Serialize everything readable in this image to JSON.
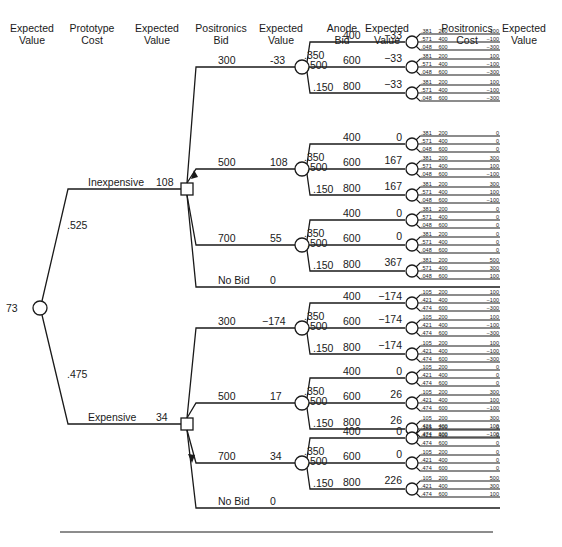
{
  "headers": [
    {
      "text": "Expected\nValue",
      "x": 5
    },
    {
      "text": "Prototype\nCost",
      "x": 65
    },
    {
      "text": "Expected\nValue",
      "x": 130
    },
    {
      "text": "Positronics\nBid",
      "x": 194
    },
    {
      "text": "Expected\nValue",
      "x": 254
    },
    {
      "text": "Anode\nBid",
      "x": 315
    },
    {
      "text": "Expected\nValue",
      "x": 360
    },
    {
      "text": "Positronics\nCost",
      "x": 440
    },
    {
      "text": "Expected\nValue",
      "x": 497
    }
  ],
  "root": {
    "expected_value": "73"
  },
  "prototype_cost": [
    {
      "label": "Inexpensive",
      "probability": ".525",
      "expected_value": "108",
      "bids": [
        {
          "bid": "300",
          "ev": "-33",
          "anode_probs": [
            ".350",
            ".500",
            ".150"
          ],
          "anodes": [
            {
              "bid": "400",
              "ev": "−33",
              "leaves": [
                [
                  "381",
                  "200",
                  "100"
                ],
                [
                  "571",
                  "400",
                  "−100"
                ],
                [
                  "048",
                  "600",
                  "−300"
                ]
              ]
            },
            {
              "bid": "600",
              "ev": "−33",
              "leaves": [
                [
                  "381",
                  "200",
                  "100"
                ],
                [
                  "571",
                  "400",
                  "−100"
                ],
                [
                  "048",
                  "600",
                  "−300"
                ]
              ]
            },
            {
              "bid": "800",
              "ev": "−33",
              "leaves": [
                [
                  "381",
                  "200",
                  "100"
                ],
                [
                  "571",
                  "400",
                  "−100"
                ],
                [
                  "048",
                  "600",
                  "−300"
                ]
              ]
            }
          ]
        },
        {
          "bid": "500",
          "ev": "108",
          "anode_probs": [
            ".350",
            ".500",
            ".150"
          ],
          "anodes": [
            {
              "bid": "400",
              "ev": "0",
              "leaves": [
                [
                  "381",
                  "200",
                  "0"
                ],
                [
                  "571",
                  "400",
                  "0"
                ],
                [
                  "048",
                  "600",
                  "0"
                ]
              ]
            },
            {
              "bid": "600",
              "ev": "167",
              "leaves": [
                [
                  "381",
                  "200",
                  "300"
                ],
                [
                  "571",
                  "400",
                  "100"
                ],
                [
                  "048",
                  "600",
                  "−100"
                ]
              ]
            },
            {
              "bid": "800",
              "ev": "167",
              "leaves": [
                [
                  "381",
                  "200",
                  "300"
                ],
                [
                  "571",
                  "400",
                  "100"
                ],
                [
                  "048",
                  "600",
                  "−100"
                ]
              ]
            }
          ]
        },
        {
          "bid": "700",
          "ev": "55",
          "anode_probs": [
            ".350",
            ".500",
            ".150"
          ],
          "anodes": [
            {
              "bid": "400",
              "ev": "0",
              "leaves": [
                [
                  "381",
                  "200",
                  "0"
                ],
                [
                  "571",
                  "400",
                  "0"
                ],
                [
                  "048",
                  "600",
                  "0"
                ]
              ]
            },
            {
              "bid": "600",
              "ev": "0",
              "leaves": [
                [
                  "381",
                  "200",
                  "0"
                ],
                [
                  "571",
                  "400",
                  "0"
                ],
                [
                  "048",
                  "600",
                  "0"
                ]
              ]
            },
            {
              "bid": "800",
              "ev": "367",
              "leaves": [
                [
                  "381",
                  "200",
                  "500"
                ],
                [
                  "571",
                  "400",
                  "300"
                ],
                [
                  "048",
                  "600",
                  "100"
                ]
              ]
            }
          ]
        },
        {
          "bid": "No Bid",
          "ev": "0"
        }
      ]
    },
    {
      "label": "Expensive",
      "probability": ".475",
      "expected_value": "34",
      "bids": [
        {
          "bid": "300",
          "ev": "−174",
          "anode_probs": [
            ".350",
            ".500",
            ".150"
          ],
          "anodes": [
            {
              "bid": "400",
              "ev": "−174",
              "leaves": [
                [
                  "105",
                  "200",
                  "100"
                ],
                [
                  "421",
                  "400",
                  "−100"
                ],
                [
                  "474",
                  "600",
                  "−300"
                ]
              ]
            },
            {
              "bid": "600",
              "ev": "−174",
              "leaves": [
                [
                  "105",
                  "200",
                  "100"
                ],
                [
                  "421",
                  "400",
                  "−100"
                ],
                [
                  "474",
                  "600",
                  "−300"
                ]
              ]
            },
            {
              "bid": "800",
              "ev": "−174",
              "leaves": [
                [
                  "105",
                  "200",
                  "100"
                ],
                [
                  "421",
                  "400",
                  "−100"
                ],
                [
                  "474",
                  "600",
                  "−300"
                ]
              ]
            }
          ]
        },
        {
          "bid": "500",
          "ev": "17",
          "anode_probs": [
            ".350",
            ".500",
            ".150"
          ],
          "anodes": [
            {
              "bid": "400",
              "ev": "0",
              "leaves": [
                [
                  "105",
                  "200",
                  "0"
                ],
                [
                  "421",
                  "400",
                  "0"
                ],
                [
                  "474",
                  "600",
                  "0"
                ]
              ]
            },
            {
              "bid": "600",
              "ev": "26",
              "leaves": [
                [
                  "105",
                  "200",
                  "300"
                ],
                [
                  "421",
                  "400",
                  "100"
                ],
                [
                  "474",
                  "600",
                  "−100"
                ]
              ]
            },
            {
              "bid": "800",
              "ev": "26",
              "leaves": [
                [
                  "105",
                  "200",
                  "300"
                ],
                [
                  "421",
                  "400",
                  "100"
                ],
                [
                  "474",
                  "600",
                  "−100"
                ]
              ]
            }
          ]
        },
        {
          "bid": "700",
          "ev": "34",
          "anode_probs": [
            ".350",
            ".500",
            ".150"
          ],
          "anodes": [
            {
              "bid": "400",
              "ev": "0",
              "leaves": [
                [
                  "105",
                  "200",
                  "0"
                ],
                [
                  "421",
                  "400",
                  "0"
                ],
                [
                  "474",
                  "600",
                  "0"
                ]
              ]
            },
            {
              "bid": "600",
              "ev": "0",
              "leaves": [
                [
                  "105",
                  "200",
                  "0"
                ],
                [
                  "421",
                  "400",
                  "0"
                ],
                [
                  "474",
                  "600",
                  "0"
                ]
              ]
            },
            {
              "bid": "800",
              "ev": "226",
              "leaves": [
                [
                  "105",
                  "200",
                  "500"
                ],
                [
                  "421",
                  "400",
                  "300"
                ],
                [
                  "474",
                  "600",
                  "100"
                ]
              ]
            }
          ]
        },
        {
          "bid": "No Bid",
          "ev": "0"
        }
      ]
    }
  ]
}
